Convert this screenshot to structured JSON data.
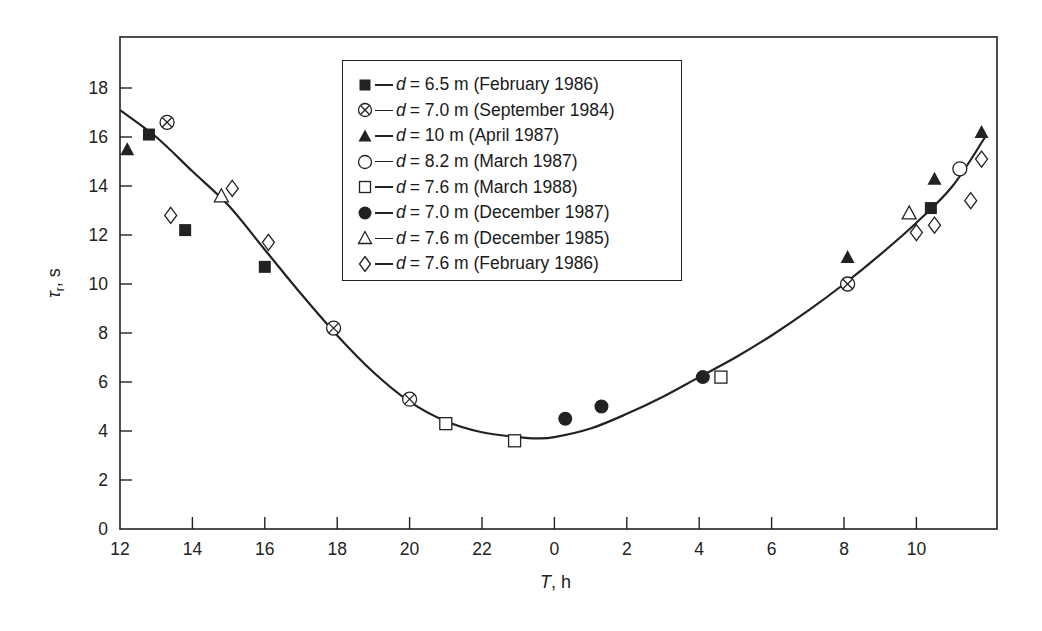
{
  "chart_data": {
    "type": "scatter",
    "title": "",
    "xlabel": "T, h",
    "ylabel": "τr, s",
    "x_tick_labels": [
      "12",
      "14",
      "16",
      "18",
      "20",
      "22",
      "0",
      "2",
      "4",
      "6",
      "8",
      "10"
    ],
    "x_ticks_continuous_hours": [
      12,
      14,
      16,
      18,
      20,
      22,
      24,
      26,
      28,
      30,
      32,
      34
    ],
    "y_tick_labels": [
      "0",
      "2",
      "4",
      "6",
      "8",
      "10",
      "12",
      "14",
      "16",
      "18"
    ],
    "xlim": [
      12,
      36.2
    ],
    "ylim": [
      0,
      20
    ],
    "grid": false,
    "legend_position": "upper center (inside plot)",
    "note": "x values are given as continuous hours from 12 h (day 1) through 12 h (day 2); e.g. 25 = 1 h on the axis",
    "series": [
      {
        "name": "d = 6.5 m (February 1986)",
        "marker": "filled-square",
        "points": [
          [
            12.8,
            16.1
          ],
          [
            13.8,
            12.2
          ],
          [
            16.0,
            10.7
          ],
          [
            34.4,
            13.1
          ]
        ]
      },
      {
        "name": "d = 7.0 m (September 1984)",
        "marker": "crossed-circle",
        "points": [
          [
            13.3,
            16.6
          ],
          [
            17.9,
            8.2
          ],
          [
            20.0,
            5.3
          ],
          [
            32.1,
            10.0
          ]
        ]
      },
      {
        "name": "d = 10 m (April 1987)",
        "marker": "filled-triangle",
        "points": [
          [
            12.2,
            15.5
          ],
          [
            32.1,
            11.1
          ],
          [
            34.5,
            14.3
          ],
          [
            35.8,
            16.2
          ]
        ]
      },
      {
        "name": "d = 8.2 m (March 1987)",
        "marker": "open-circle",
        "points": [
          [
            35.2,
            14.7
          ]
        ]
      },
      {
        "name": "d = 7.6 m (March 1988)",
        "marker": "open-square",
        "points": [
          [
            21.0,
            4.3
          ],
          [
            22.9,
            3.6
          ],
          [
            28.6,
            6.2
          ]
        ]
      },
      {
        "name": "d = 7.0 m (December 1987)",
        "marker": "filled-circle",
        "points": [
          [
            24.3,
            4.5
          ],
          [
            25.3,
            5.0
          ],
          [
            28.1,
            6.2
          ]
        ]
      },
      {
        "name": "d = 7.6 m (December 1985)",
        "marker": "open-triangle",
        "points": [
          [
            14.8,
            13.6
          ],
          [
            33.8,
            12.9
          ]
        ]
      },
      {
        "name": "d = 7.6 m (February 1986)",
        "marker": "open-diamond",
        "points": [
          [
            13.4,
            12.8
          ],
          [
            15.1,
            13.9
          ],
          [
            16.1,
            11.7
          ],
          [
            34.0,
            12.1
          ],
          [
            34.5,
            12.4
          ],
          [
            35.5,
            13.4
          ],
          [
            35.8,
            15.1
          ]
        ]
      }
    ],
    "fit_curve": {
      "name": "fitted curve",
      "style": "solid black line",
      "points": [
        [
          12,
          17.1
        ],
        [
          13,
          16.0
        ],
        [
          14,
          14.6
        ],
        [
          15,
          13.2
        ],
        [
          16,
          11.4
        ],
        [
          17,
          9.6
        ],
        [
          18,
          7.9
        ],
        [
          19,
          6.4
        ],
        [
          20,
          5.2
        ],
        [
          21,
          4.4
        ],
        [
          22,
          3.95
        ],
        [
          23,
          3.75
        ],
        [
          23.5,
          3.7
        ],
        [
          24,
          3.75
        ],
        [
          25,
          4.1
        ],
        [
          26,
          4.7
        ],
        [
          27,
          5.4
        ],
        [
          28,
          6.2
        ],
        [
          29,
          7.0
        ],
        [
          30,
          7.9
        ],
        [
          31,
          8.9
        ],
        [
          32,
          10.0
        ],
        [
          33,
          11.2
        ],
        [
          34,
          12.5
        ],
        [
          35,
          14.0
        ],
        [
          35.9,
          16.0
        ]
      ]
    }
  },
  "legend": {
    "items": [
      {
        "marker": "filled-square",
        "var": "d",
        "text": "= 6.5 m (February 1986)"
      },
      {
        "marker": "crossed-circle",
        "var": "d",
        "text": "= 7.0 m (September 1984)"
      },
      {
        "marker": "filled-triangle",
        "var": "d",
        "text": "= 10 m (April 1987)"
      },
      {
        "marker": "open-circle",
        "var": "d",
        "text": "= 8.2 m (March 1987)"
      },
      {
        "marker": "open-square",
        "var": "d",
        "text": "= 7.6 m (March 1988)"
      },
      {
        "marker": "filled-circle",
        "var": "d",
        "text": "= 7.0 m (December 1987)"
      },
      {
        "marker": "open-triangle",
        "var": "d",
        "text": "= 7.6 m (December 1985)"
      },
      {
        "marker": "open-diamond",
        "var": "d",
        "text": "= 7.6 m (February 1986)"
      }
    ]
  },
  "axes": {
    "x_title_var": "T",
    "x_title_unit": ", h",
    "y_title_var": "τ",
    "y_title_sub": "r",
    "y_title_unit": ", s"
  },
  "colors": {
    "ink": "#222222",
    "background": "#ffffff"
  }
}
